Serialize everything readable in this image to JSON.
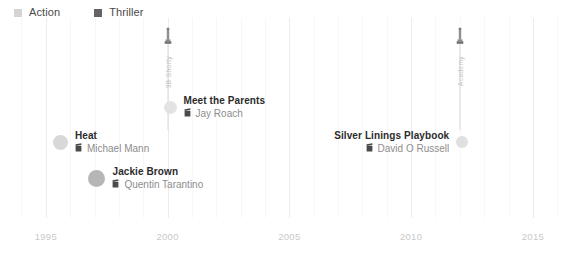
{
  "legend": {
    "items": [
      {
        "label": "Action",
        "color": "#d4d4d4",
        "icon": "square-swatch-icon"
      },
      {
        "label": "Thriller",
        "color": "#636363",
        "icon": "square-swatch-icon"
      }
    ]
  },
  "axis": {
    "ticks": [
      "1995",
      "2000",
      "2005",
      "2010",
      "2015"
    ],
    "range": [
      1993.2,
      2016.4
    ]
  },
  "awards": [
    {
      "text": "3B Shorty",
      "year": 2000.0,
      "icon": "award-statuette-icon"
    },
    {
      "text": "Academy",
      "year": 2012.0,
      "icon": "award-statuette-icon"
    }
  ],
  "films": [
    {
      "title": "Heat",
      "director": "Michael Mann",
      "year": 1995.6,
      "genre": "Action",
      "dot_color": "#d8d8d8",
      "dot_size": 15,
      "label_side": "right",
      "y": 146,
      "icon": "director-chair-icon"
    },
    {
      "title": "Jackie Brown",
      "director": "Quentin Tarantino",
      "year": 1997.1,
      "genre": "Thriller",
      "dot_color": "#b6b6b6",
      "dot_size": 17,
      "label_side": "right",
      "y": 182,
      "icon": "director-chair-icon"
    },
    {
      "title": "Meet the Parents",
      "director": "Jay Roach",
      "year": 2000.1,
      "genre": "Action",
      "dot_color": "#e3e3e3",
      "dot_size": 13,
      "label_side": "right",
      "y": 111,
      "icon": "director-chair-icon"
    },
    {
      "title": "Silver Linings Playbook",
      "director": "David O Russell",
      "year": 2012.1,
      "genre": "Action",
      "dot_color": "#e0e0e0",
      "dot_size": 12,
      "label_side": "left",
      "y": 146,
      "icon": "director-chair-icon"
    }
  ],
  "chart_data": {
    "type": "scatter",
    "title": "",
    "xlabel": "",
    "ylabel": "",
    "xlim": [
      1993.2,
      2016.4
    ],
    "xticks": [
      1995,
      2000,
      2005,
      2010,
      2015
    ],
    "grid": true,
    "legend_position": "top-left",
    "legend_entries": [
      "Action",
      "Thriller"
    ],
    "points": [
      {
        "label": "Heat",
        "sublabel": "Michael Mann",
        "x": 1995.6,
        "series": "Action",
        "size": 15
      },
      {
        "label": "Jackie Brown",
        "sublabel": "Quentin Tarantino",
        "x": 1997.1,
        "series": "Thriller",
        "size": 17
      },
      {
        "label": "Meet the Parents",
        "sublabel": "Jay Roach",
        "x": 2000.1,
        "series": "Action",
        "size": 13
      },
      {
        "label": "Silver Linings Playbook",
        "sublabel": "David O Russell",
        "x": 2012.1,
        "series": "Action",
        "size": 12
      }
    ],
    "annotations": [
      {
        "text": "3B Shorty",
        "x": 2000.0
      },
      {
        "text": "Academy",
        "x": 2012.0
      }
    ]
  }
}
